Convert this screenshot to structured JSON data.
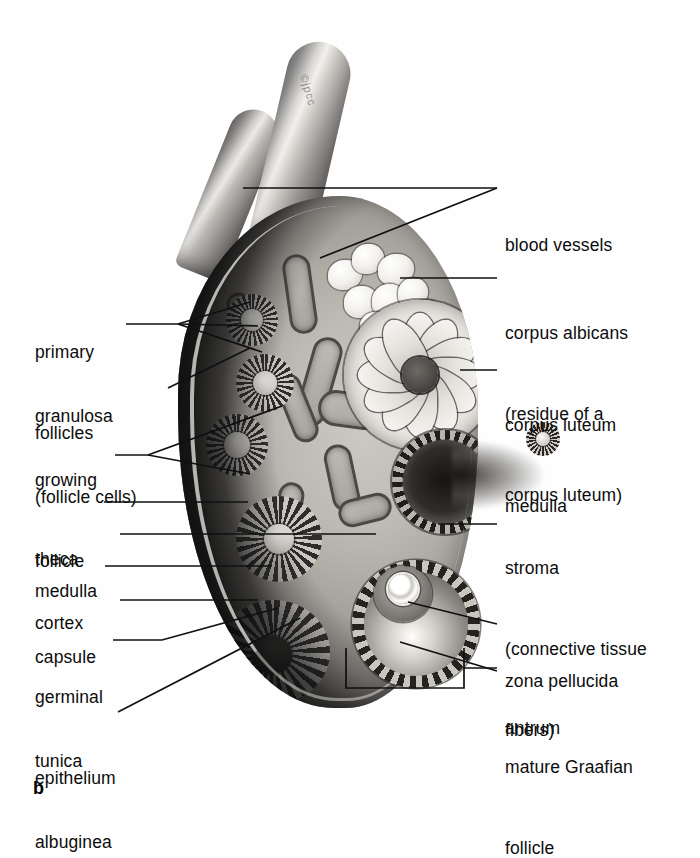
{
  "figure": {
    "letter": "b",
    "watermark": "©jpcc"
  },
  "labels_left": [
    {
      "name": "primary-follicles",
      "lines": [
        "primary",
        "follicles"
      ],
      "x": 35,
      "y": 285
    },
    {
      "name": "granulosa",
      "lines": [
        "granulosa",
        "(follicle cells)"
      ],
      "x": 35,
      "y": 349
    },
    {
      "name": "growing-follicle",
      "lines": [
        "growing",
        "follicle"
      ],
      "x": 35,
      "y": 413
    },
    {
      "name": "theca",
      "lines": [
        "theca"
      ],
      "x": 35,
      "y": 492
    },
    {
      "name": "medulla",
      "lines": [
        "medulla"
      ],
      "x": 35,
      "y": 524
    },
    {
      "name": "cortex",
      "lines": [
        "cortex"
      ],
      "x": 35,
      "y": 556
    },
    {
      "name": "capsule",
      "lines": [
        "capsule"
      ],
      "x": 35,
      "y": 590
    },
    {
      "name": "germinal-epithelium",
      "lines": [
        "germinal",
        "epithelium"
      ],
      "x": 35,
      "y": 630
    },
    {
      "name": "tunica-albuginea",
      "lines": [
        "tunica",
        "albuginea"
      ],
      "x": 35,
      "y": 694
    }
  ],
  "labels_right": [
    {
      "name": "blood-vessels",
      "lines": [
        "blood vessels"
      ],
      "x": 505,
      "y": 178
    },
    {
      "name": "corpus-albicans",
      "lines": [
        "corpus albicans",
        "(residue of a",
        "corpus luteum)"
      ],
      "x": 505,
      "y": 266
    },
    {
      "name": "corpus-luteum-medulla",
      "lines": [
        "corpus luteum",
        "medulla"
      ],
      "x": 505,
      "y": 358
    },
    {
      "name": "stroma",
      "lines": [
        "stroma",
        "(connective tissue",
        "fibers)"
      ],
      "x": 505,
      "y": 501
    },
    {
      "name": "zona-pellucida",
      "lines": [
        "zona pellucida"
      ],
      "x": 505,
      "y": 614
    },
    {
      "name": "antrum",
      "lines": [
        "antrum"
      ],
      "x": 505,
      "y": 661
    },
    {
      "name": "mature-graafian-follicle",
      "lines": [
        "mature Graafian",
        "follicle"
      ],
      "x": 505,
      "y": 700
    }
  ],
  "colors": {
    "ink": "#0c0c0c",
    "leader": "#101010",
    "background": "#ffffff",
    "tissue_light": "#cdcac4",
    "tissue_mid": "#a8a49e",
    "tissue_dark": "#3a3734"
  },
  "illustration": {
    "structures": [
      "blood-vessel-upper-left",
      "blood-vessel-upper-right",
      "ovary-body",
      "capsule-rim",
      "cortex-band",
      "primary-follicle-1",
      "primary-follicle-2",
      "primary-follicle-3",
      "growing-follicle-1",
      "growing-follicle-2",
      "corpus-albicans",
      "corpus-luteum",
      "ruptured-follicle",
      "expelled-ovum",
      "mature-graafian-follicle",
      "medulla-vessel-channels"
    ]
  }
}
